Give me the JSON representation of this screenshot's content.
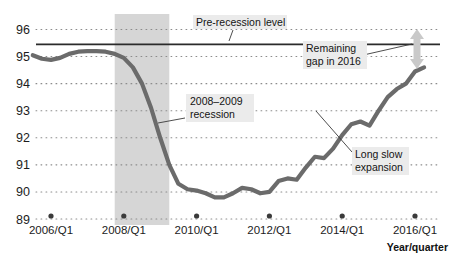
{
  "chart_data": {
    "type": "line",
    "title": "",
    "xlabel": "Year/quarter",
    "ylabel": "",
    "ylim": [
      89,
      96
    ],
    "yticks": [
      89,
      90,
      91,
      92,
      93,
      94,
      95,
      96
    ],
    "ytick_labels": [
      "89",
      "90",
      "91",
      "92",
      "93",
      "94",
      "95",
      "96"
    ],
    "xticks": [
      "2006/Q1",
      "2008/Q1",
      "2010/Q1",
      "2012/Q1",
      "2014/Q1",
      "2016/Q1"
    ],
    "grid": "horizontal-dotted",
    "legend": "none",
    "series": [
      {
        "name": "Index level",
        "x": [
          "2005/Q3",
          "2005/Q4",
          "2006/Q1",
          "2006/Q2",
          "2006/Q3",
          "2006/Q4",
          "2007/Q1",
          "2007/Q2",
          "2007/Q3",
          "2007/Q4",
          "2008/Q1",
          "2008/Q2",
          "2008/Q3",
          "2008/Q4",
          "2009/Q1",
          "2009/Q2",
          "2009/Q3",
          "2009/Q4",
          "2010/Q1",
          "2010/Q2",
          "2010/Q3",
          "2010/Q4",
          "2011/Q1",
          "2011/Q2",
          "2011/Q3",
          "2011/Q4",
          "2012/Q1",
          "2012/Q2",
          "2012/Q3",
          "2012/Q4",
          "2013/Q1",
          "2013/Q2",
          "2013/Q3",
          "2013/Q4",
          "2014/Q1",
          "2014/Q2",
          "2014/Q3",
          "2014/Q4",
          "2015/Q1",
          "2015/Q2",
          "2015/Q3",
          "2015/Q4",
          "2016/Q1",
          "2016/Q2"
        ],
        "values": [
          95.05,
          94.92,
          94.88,
          94.95,
          95.1,
          95.18,
          95.2,
          95.2,
          95.18,
          95.1,
          94.95,
          94.6,
          94.0,
          93.1,
          92.0,
          91.0,
          90.3,
          90.1,
          90.05,
          89.95,
          89.8,
          89.8,
          89.95,
          90.15,
          90.1,
          89.95,
          90.0,
          90.4,
          90.5,
          90.45,
          90.9,
          91.3,
          91.25,
          91.6,
          92.1,
          92.5,
          92.6,
          92.45,
          93.0,
          93.5,
          93.8,
          94.0,
          94.45,
          94.6
        ]
      }
    ],
    "reference_line": {
      "name": "Pre-recession level",
      "value": 95.45
    },
    "shaded_band": {
      "name": "2008-2009 recession",
      "start": "2007/Q4",
      "end": "2009/Q2"
    },
    "annotations": [
      {
        "id": "pre-recession-level",
        "text": "Pre-recession level"
      },
      {
        "id": "recession-band",
        "text": "2008–2009\nrecession",
        "line1": "2008–2009",
        "line2": "recession"
      },
      {
        "id": "remaining-gap",
        "text": "Remaining\ngap in 2016",
        "line1": "Remaining",
        "line2": "gap in 2016"
      },
      {
        "id": "long-slow-expansion",
        "text": "Long slow\nexpansion",
        "line1": "Long slow",
        "line2": "expansion"
      }
    ],
    "colors": {
      "line": "#6b6b6b",
      "band": "#d6d6d6",
      "reference_line": "#2b2b2b",
      "grid": "#8c8c8c",
      "arrow": "#c9c9c9",
      "annotation_bg": "#ebebeb",
      "text": "#1a1a1a"
    }
  }
}
